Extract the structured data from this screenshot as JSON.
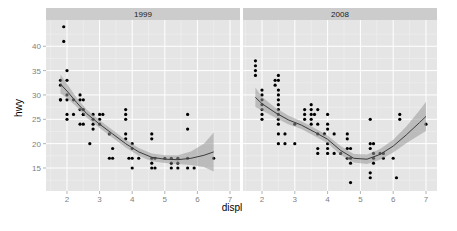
{
  "chart_data": {
    "type": "scatter",
    "title": "",
    "xlabel": "displ",
    "ylabel": "hwy",
    "facet_by": "year",
    "xlim": [
      1.4,
      7.3
    ],
    "ylim": [
      10,
      45
    ],
    "x_ticks": [
      2,
      3,
      4,
      5,
      6,
      7
    ],
    "y_ticks": [
      15,
      20,
      25,
      30,
      35,
      40
    ],
    "grid": true,
    "legend": "none",
    "smoother": "loess with confidence band",
    "panels": [
      {
        "label": "1999",
        "points": [
          [
            1.8,
            29
          ],
          [
            1.8,
            29
          ],
          [
            1.8,
            32
          ],
          [
            1.8,
            33
          ],
          [
            1.9,
            44
          ],
          [
            1.9,
            41
          ],
          [
            2.0,
            35
          ],
          [
            2.0,
            33
          ],
          [
            2.0,
            30
          ],
          [
            2.0,
            26
          ],
          [
            2.0,
            29
          ],
          [
            2.0,
            25
          ],
          [
            2.2,
            26
          ],
          [
            2.2,
            29
          ],
          [
            2.4,
            27
          ],
          [
            2.4,
            29
          ],
          [
            2.4,
            24
          ],
          [
            2.4,
            30
          ],
          [
            2.5,
            26
          ],
          [
            2.5,
            24
          ],
          [
            2.5,
            27
          ],
          [
            2.5,
            26
          ],
          [
            2.5,
            29
          ],
          [
            2.7,
            20
          ],
          [
            2.8,
            26
          ],
          [
            2.8,
            24
          ],
          [
            2.8,
            23
          ],
          [
            2.8,
            25
          ],
          [
            3.0,
            26
          ],
          [
            3.0,
            24
          ],
          [
            3.0,
            25
          ],
          [
            3.1,
            26
          ],
          [
            3.3,
            22
          ],
          [
            3.3,
            17
          ],
          [
            3.4,
            19
          ],
          [
            3.4,
            17
          ],
          [
            3.8,
            27
          ],
          [
            3.8,
            26
          ],
          [
            3.8,
            25
          ],
          [
            3.8,
            22
          ],
          [
            3.8,
            21
          ],
          [
            4.0,
            20
          ],
          [
            4.0,
            19
          ],
          [
            4.0,
            17
          ],
          [
            4.0,
            15
          ],
          [
            3.9,
            17
          ],
          [
            4.2,
            17
          ],
          [
            4.6,
            22
          ],
          [
            4.6,
            21
          ],
          [
            4.6,
            17
          ],
          [
            4.6,
            16
          ],
          [
            4.6,
            15
          ],
          [
            4.7,
            17
          ],
          [
            4.7,
            15
          ],
          [
            5.0,
            17
          ],
          [
            5.2,
            17
          ],
          [
            5.2,
            16
          ],
          [
            5.2,
            15
          ],
          [
            5.4,
            17
          ],
          [
            5.4,
            16
          ],
          [
            5.4,
            15
          ],
          [
            5.7,
            26
          ],
          [
            5.7,
            23
          ],
          [
            5.7,
            17
          ],
          [
            5.7,
            15
          ],
          [
            5.9,
            15
          ],
          [
            6.5,
            17
          ]
        ],
        "smooth": [
          [
            1.8,
            32.2
          ],
          [
            2.0,
            30.8
          ],
          [
            2.3,
            28.4
          ],
          [
            2.6,
            26.2
          ],
          [
            3.0,
            24.0
          ],
          [
            3.4,
            22.0
          ],
          [
            3.8,
            20.0
          ],
          [
            4.2,
            18.3
          ],
          [
            4.6,
            17.2
          ],
          [
            5.0,
            16.8
          ],
          [
            5.4,
            16.7
          ],
          [
            5.8,
            17.0
          ],
          [
            6.2,
            17.6
          ],
          [
            6.5,
            18.3
          ]
        ],
        "band": [
          [
            1.8,
            34.2,
            30.3
          ],
          [
            2.0,
            32.3,
            29.4
          ],
          [
            2.3,
            29.4,
            27.5
          ],
          [
            2.6,
            27.0,
            25.4
          ],
          [
            3.0,
            24.8,
            23.2
          ],
          [
            3.4,
            22.8,
            21.2
          ],
          [
            3.8,
            20.8,
            19.2
          ],
          [
            4.2,
            19.1,
            17.5
          ],
          [
            4.6,
            18.0,
            16.4
          ],
          [
            5.0,
            17.6,
            16.0
          ],
          [
            5.4,
            17.6,
            15.8
          ],
          [
            5.8,
            18.4,
            15.6
          ],
          [
            6.2,
            20.0,
            15.2
          ],
          [
            6.5,
            22.3,
            14.3
          ]
        ]
      },
      {
        "label": "2008",
        "points": [
          [
            1.8,
            37
          ],
          [
            1.8,
            36
          ],
          [
            1.8,
            35
          ],
          [
            1.8,
            34
          ],
          [
            2.0,
            31
          ],
          [
            2.0,
            30
          ],
          [
            2.0,
            29
          ],
          [
            2.0,
            28
          ],
          [
            2.0,
            27
          ],
          [
            2.0,
            26
          ],
          [
            2.0,
            25
          ],
          [
            2.4,
            32
          ],
          [
            2.4,
            33
          ],
          [
            2.5,
            33
          ],
          [
            2.5,
            34
          ],
          [
            2.5,
            31
          ],
          [
            2.5,
            30
          ],
          [
            2.5,
            29
          ],
          [
            2.5,
            28
          ],
          [
            2.5,
            27
          ],
          [
            2.5,
            26
          ],
          [
            2.5,
            25
          ],
          [
            2.5,
            24
          ],
          [
            2.5,
            22
          ],
          [
            2.5,
            20
          ],
          [
            2.7,
            20
          ],
          [
            2.7,
            22
          ],
          [
            3.0,
            24
          ],
          [
            3.0,
            20
          ],
          [
            3.3,
            26
          ],
          [
            3.3,
            25
          ],
          [
            3.3,
            27
          ],
          [
            3.5,
            28
          ],
          [
            3.5,
            27
          ],
          [
            3.5,
            26
          ],
          [
            3.5,
            25
          ],
          [
            3.5,
            24
          ],
          [
            3.6,
            26
          ],
          [
            3.7,
            27
          ],
          [
            3.7,
            24
          ],
          [
            3.7,
            22
          ],
          [
            3.7,
            19
          ],
          [
            3.7,
            18
          ],
          [
            3.9,
            22
          ],
          [
            4.0,
            26
          ],
          [
            4.0,
            24
          ],
          [
            4.0,
            23
          ],
          [
            4.0,
            20
          ],
          [
            4.0,
            19
          ],
          [
            4.0,
            18
          ],
          [
            4.2,
            22
          ],
          [
            4.2,
            18
          ],
          [
            4.4,
            18
          ],
          [
            4.6,
            22
          ],
          [
            4.6,
            21
          ],
          [
            4.6,
            19
          ],
          [
            4.6,
            17
          ],
          [
            4.7,
            19
          ],
          [
            4.7,
            17
          ],
          [
            4.7,
            16
          ],
          [
            4.7,
            12
          ],
          [
            5.3,
            25
          ],
          [
            5.3,
            20
          ],
          [
            5.3,
            19
          ],
          [
            5.3,
            14
          ],
          [
            5.3,
            13
          ],
          [
            5.4,
            20
          ],
          [
            5.4,
            18
          ],
          [
            5.4,
            17
          ],
          [
            5.4,
            16
          ],
          [
            5.6,
            18
          ],
          [
            5.7,
            18
          ],
          [
            5.7,
            17
          ],
          [
            6.0,
            17
          ],
          [
            6.1,
            13
          ],
          [
            6.2,
            26
          ],
          [
            6.2,
            25
          ],
          [
            7.0,
            24
          ]
        ],
        "smooth": [
          [
            1.8,
            29.5
          ],
          [
            2.0,
            28.2
          ],
          [
            2.4,
            26.4
          ],
          [
            2.8,
            24.9
          ],
          [
            3.2,
            23.8
          ],
          [
            3.6,
            22.4
          ],
          [
            4.0,
            20.9
          ],
          [
            4.4,
            18.6
          ],
          [
            4.8,
            17.0
          ],
          [
            5.2,
            16.8
          ],
          [
            5.6,
            17.8
          ],
          [
            6.0,
            19.5
          ],
          [
            6.4,
            21.8
          ],
          [
            6.8,
            24.3
          ],
          [
            7.0,
            25.6
          ]
        ],
        "band": [
          [
            1.8,
            31.5,
            27.5
          ],
          [
            2.0,
            29.6,
            26.8
          ],
          [
            2.4,
            27.4,
            25.4
          ],
          [
            2.8,
            25.8,
            24.0
          ],
          [
            3.2,
            24.6,
            23.0
          ],
          [
            3.6,
            23.2,
            21.6
          ],
          [
            4.0,
            21.7,
            20.1
          ],
          [
            4.4,
            19.5,
            17.7
          ],
          [
            4.8,
            17.9,
            16.1
          ],
          [
            5.2,
            17.8,
            15.8
          ],
          [
            5.6,
            18.9,
            16.7
          ],
          [
            6.0,
            20.8,
            18.2
          ],
          [
            6.4,
            23.5,
            20.1
          ],
          [
            6.8,
            26.8,
            21.8
          ],
          [
            7.0,
            28.6,
            22.6
          ]
        ]
      }
    ]
  },
  "colors": {
    "panel_bg": "#e5e5e5",
    "strip_bg": "#cccccc",
    "grid_major": "#ffffff",
    "grid_minor": "#f2f2f2",
    "point": "#000000",
    "smooth_line": "#3b3b3b",
    "band": "#999999"
  }
}
